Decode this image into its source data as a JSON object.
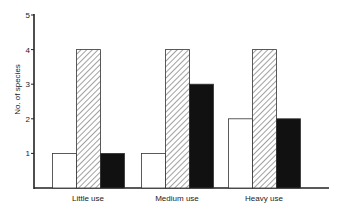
{
  "chart_data": {
    "type": "bar",
    "title": "",
    "xlabel": "",
    "ylabel": "No. of species",
    "ylim": [
      0,
      5
    ],
    "yticks": [
      1,
      2,
      3,
      4,
      5
    ],
    "grid": false,
    "legend": null,
    "categories": [
      "Little use",
      "Medium use",
      "Heavy use"
    ],
    "series": [
      {
        "name": "Series A (open)",
        "fill": "white",
        "values": [
          1,
          1,
          2
        ]
      },
      {
        "name": "Series B (hatched)",
        "fill": "hatched",
        "values": [
          4,
          4,
          4
        ]
      },
      {
        "name": "Series C (solid)",
        "fill": "black",
        "values": [
          1,
          3,
          2
        ]
      }
    ]
  },
  "colors": {
    "axis": "#222222",
    "bar_outline": "#333333",
    "solid_fill": "#111111",
    "open_fill": "#ffffff",
    "hatch_line": "#444444"
  }
}
